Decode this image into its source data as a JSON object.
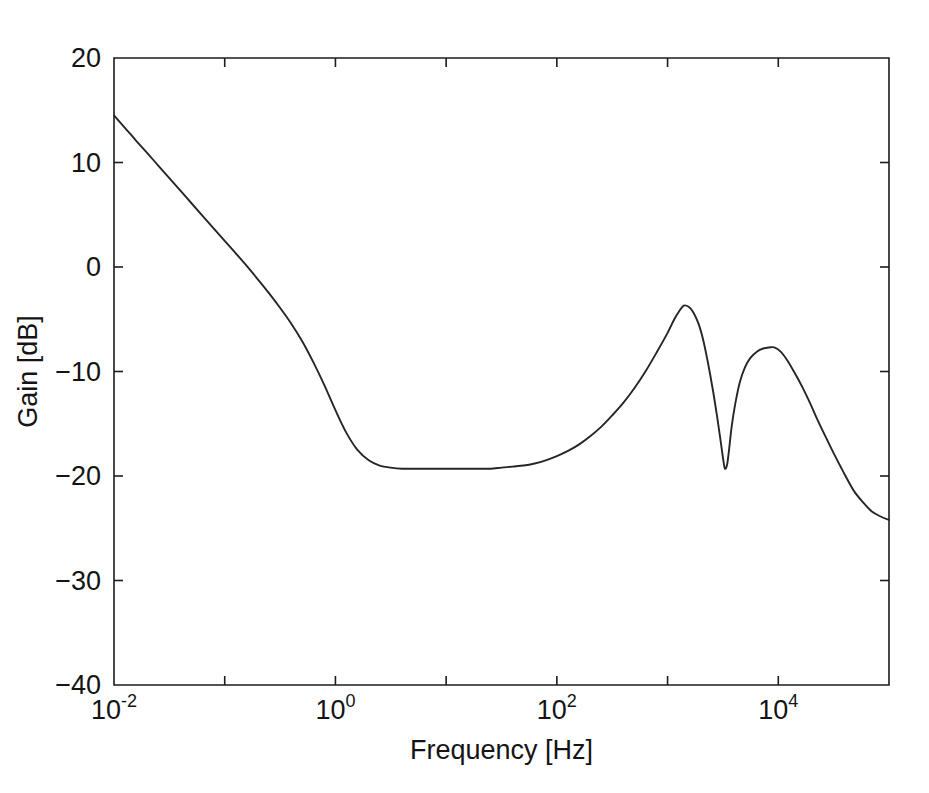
{
  "chart_data": {
    "type": "line",
    "title": "",
    "subtitle": "",
    "xlabel": "Frequency [Hz]",
    "ylabel": "Gain [dB]",
    "xscale": "log",
    "yscale": "linear",
    "xlim": [
      0.01,
      100000
    ],
    "ylim": [
      -40,
      20
    ],
    "grid": false,
    "legend": null,
    "line_color": "#262626",
    "background_color": "#ffffff",
    "axis_color": "#1c1c1c",
    "x_ticks": [
      {
        "value": 0.01,
        "base": "10",
        "exponent": "-2",
        "label": "10^-2"
      },
      {
        "value": 1,
        "base": "10",
        "exponent": "0",
        "label": "10^0"
      },
      {
        "value": 100,
        "base": "10",
        "exponent": "2",
        "label": "10^2"
      },
      {
        "value": 10000,
        "base": "10",
        "exponent": "4",
        "label": "10^4"
      }
    ],
    "y_ticks": [
      {
        "value": 20,
        "label": "20"
      },
      {
        "value": 10,
        "label": "10"
      },
      {
        "value": 0,
        "label": "0"
      },
      {
        "value": -10,
        "label": "−10"
      },
      {
        "value": -20,
        "label": "−20"
      },
      {
        "value": -30,
        "label": "−30"
      },
      {
        "value": -40,
        "label": "−40"
      }
    ],
    "series": [
      {
        "name": "gain",
        "points": [
          [
            0.01,
            14.5
          ],
          [
            0.0126,
            13.3
          ],
          [
            0.0158,
            12.1
          ],
          [
            0.02,
            10.9
          ],
          [
            0.0251,
            9.7
          ],
          [
            0.0316,
            8.5
          ],
          [
            0.0398,
            7.3
          ],
          [
            0.0501,
            6.1
          ],
          [
            0.0631,
            4.9
          ],
          [
            0.0794,
            3.7
          ],
          [
            0.1,
            2.5
          ],
          [
            0.126,
            1.3
          ],
          [
            0.158,
            0.1
          ],
          [
            0.2,
            -1.2
          ],
          [
            0.251,
            -2.5
          ],
          [
            0.316,
            -3.9
          ],
          [
            0.398,
            -5.4
          ],
          [
            0.501,
            -7.1
          ],
          [
            0.631,
            -9.1
          ],
          [
            0.794,
            -11.3
          ],
          [
            1.0,
            -13.7
          ],
          [
            1.26,
            -15.9
          ],
          [
            1.58,
            -17.5
          ],
          [
            2.0,
            -18.5
          ],
          [
            2.51,
            -19.0
          ],
          [
            3.16,
            -19.2
          ],
          [
            4.0,
            -19.3
          ],
          [
            5.01,
            -19.3
          ],
          [
            6.31,
            -19.3
          ],
          [
            7.94,
            -19.3
          ],
          [
            10.0,
            -19.3
          ],
          [
            12.6,
            -19.3
          ],
          [
            15.8,
            -19.3
          ],
          [
            20.0,
            -19.3
          ],
          [
            25.1,
            -19.3
          ],
          [
            31.6,
            -19.2
          ],
          [
            39.8,
            -19.1
          ],
          [
            50.1,
            -19.0
          ],
          [
            63.1,
            -18.8
          ],
          [
            79.4,
            -18.5
          ],
          [
            100.0,
            -18.1
          ],
          [
            126.0,
            -17.6
          ],
          [
            158.0,
            -17.0
          ],
          [
            200.0,
            -16.2
          ],
          [
            251.0,
            -15.3
          ],
          [
            316.0,
            -14.2
          ],
          [
            398.0,
            -13.0
          ],
          [
            501.0,
            -11.6
          ],
          [
            631.0,
            -10.0
          ],
          [
            794.0,
            -8.2
          ],
          [
            1000.0,
            -6.3
          ],
          [
            1150.0,
            -5.0
          ],
          [
            1260.0,
            -4.3
          ],
          [
            1400.0,
            -3.7
          ],
          [
            1550.0,
            -3.8
          ],
          [
            1700.0,
            -4.3
          ],
          [
            1900.0,
            -5.4
          ],
          [
            2100.0,
            -7.0
          ],
          [
            2300.0,
            -9.0
          ],
          [
            2550.0,
            -11.6
          ],
          [
            2800.0,
            -14.3
          ],
          [
            3000.0,
            -16.5
          ],
          [
            3200.0,
            -18.6
          ],
          [
            3300.0,
            -19.3
          ],
          [
            3450.0,
            -18.9
          ],
          [
            3600.0,
            -17.4
          ],
          [
            3800.0,
            -15.2
          ],
          [
            4100.0,
            -13.0
          ],
          [
            4500.0,
            -11.0
          ],
          [
            5000.0,
            -9.6
          ],
          [
            5600.0,
            -8.7
          ],
          [
            6400.0,
            -8.1
          ],
          [
            7300.0,
            -7.8
          ],
          [
            8300.0,
            -7.7
          ],
          [
            9200.0,
            -7.7
          ],
          [
            10500.0,
            -8.1
          ],
          [
            12000.0,
            -8.9
          ],
          [
            14000.0,
            -10.1
          ],
          [
            16500.0,
            -11.5
          ],
          [
            19500.0,
            -13.1
          ],
          [
            23000.0,
            -14.8
          ],
          [
            27500.0,
            -16.5
          ],
          [
            33000.0,
            -18.2
          ],
          [
            40000.0,
            -19.9
          ],
          [
            48000.0,
            -21.4
          ],
          [
            58000.0,
            -22.5
          ],
          [
            70000.0,
            -23.4
          ],
          [
            85000.0,
            -23.9
          ],
          [
            100000.0,
            -24.2
          ]
        ]
      }
    ],
    "annotations": {
      "start_value_db": 14.5,
      "plateau_value_db": -19.3,
      "first_resonance_peak_db": -3.7,
      "first_resonance_peak_hz": 1400,
      "notch_db": -19.3,
      "notch_hz": 3300,
      "second_resonance_peak_db": -7.7,
      "second_resonance_peak_hz": 9200,
      "end_value_db": -24.2
    }
  }
}
